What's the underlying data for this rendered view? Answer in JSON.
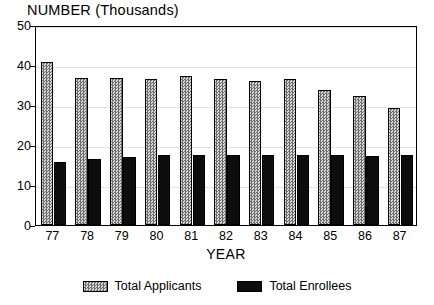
{
  "chart_data": {
    "type": "bar",
    "title": "NUMBER (Thousands)",
    "xlabel": "YEAR",
    "ylabel": "NUMBER (Thousands)",
    "categories": [
      "77",
      "78",
      "79",
      "80",
      "81",
      "82",
      "83",
      "84",
      "85",
      "86",
      "87"
    ],
    "series": [
      {
        "name": "Total Applicants",
        "color": "#a8a8a8",
        "pattern": "checkered-hatch",
        "values": [
          40.7,
          36.8,
          36.7,
          36.6,
          37.3,
          36.4,
          35.9,
          36.5,
          33.8,
          32.3,
          29.3
        ]
      },
      {
        "name": "Total Enrollees",
        "color": "#0d0d0d",
        "pattern": "solid",
        "values": [
          15.7,
          16.4,
          17.0,
          17.5,
          17.6,
          17.5,
          17.5,
          17.6,
          17.5,
          17.3,
          17.5
        ]
      }
    ],
    "ylim": [
      0,
      50
    ],
    "yticks": [
      0,
      10,
      20,
      30,
      40,
      50
    ],
    "ytick_labels": [
      "0",
      "10",
      "20",
      "30",
      "40",
      "50"
    ],
    "grid": true,
    "legend_position": "bottom"
  },
  "legend": {
    "entries": [
      {
        "label": "Total Applicants"
      },
      {
        "label": "Total Enrollees"
      }
    ]
  }
}
